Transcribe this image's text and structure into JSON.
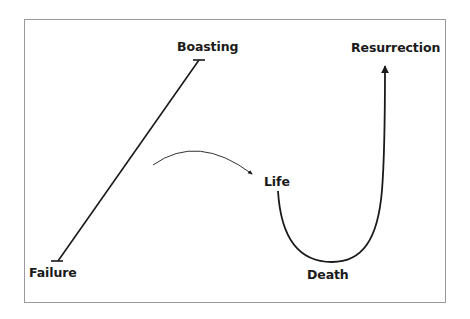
{
  "diagram": {
    "type": "concept-diagram",
    "frame": {
      "border_color": "#9a9a9a",
      "background": "#ffffff"
    },
    "stroke_color": "#1a1a1a",
    "labels": {
      "boasting": "Boasting",
      "failure": "Failure",
      "life": "Life",
      "death": "Death",
      "resurrection": "Resurrection"
    },
    "paths": [
      {
        "id": "boasting-failure-line",
        "from": "Failure",
        "to": "Boasting",
        "style": "straight line with T-bar ends"
      },
      {
        "id": "transition-arc",
        "style": "thin curved arrow pointing toward Life"
      },
      {
        "id": "life-death-resurrection-curve",
        "from": "Life",
        "via": "Death",
        "to": "Resurrection",
        "style": "U-shaped curve with arrowhead at top"
      }
    ]
  }
}
